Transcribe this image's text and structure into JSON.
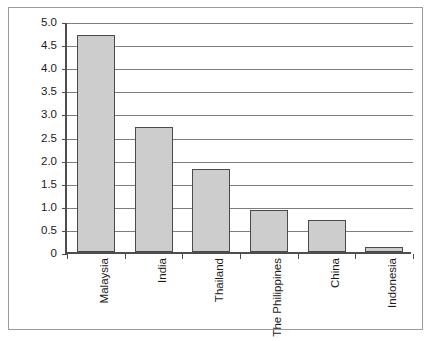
{
  "chart_data": {
    "type": "bar",
    "title": "",
    "subtitle": "",
    "xlabel": "",
    "ylabel": "",
    "categories": [
      "Malaysia",
      "India",
      "Thailand",
      "The Philippines",
      "China",
      "Indonesia"
    ],
    "values": [
      4.7,
      2.7,
      1.8,
      0.9,
      0.7,
      0.1
    ],
    "series": [
      {
        "name": "",
        "values": [
          4.7,
          2.7,
          1.8,
          0.9,
          0.7,
          0.1
        ]
      }
    ],
    "ylim": [
      0,
      5.0
    ],
    "ytick_step": 0.5,
    "ytick_labels": [
      "5.0",
      "4.5",
      "4.0",
      "3.5",
      "3.0",
      "2.5",
      "2.0",
      "1.5",
      "1.0",
      "0.5",
      "0"
    ],
    "ytick_values": [
      5.0,
      4.5,
      4.0,
      3.5,
      3.0,
      2.5,
      2.0,
      1.5,
      1.0,
      0.5,
      0
    ],
    "grid": true,
    "grid_axis": "y",
    "legend": false,
    "legend_position": "none",
    "annotations": [],
    "colors": {
      "bar_fill": "#cdcdcd",
      "bar_border": "#4a4a4a",
      "gridline": "#7d7d7d",
      "axis": "#4d4d4d",
      "frame": "#9a9a9a",
      "background": "#ffffff",
      "text": "#1a1a1a"
    }
  }
}
